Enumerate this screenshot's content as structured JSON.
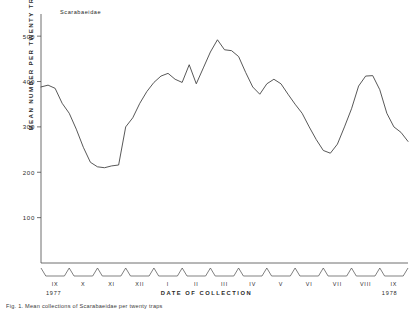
{
  "figure": {
    "annotation": "Scarabaeidae",
    "caption": "Fig. 1. Mean collections of Scarabaeidae per twenty traps"
  },
  "chart_data": {
    "type": "line",
    "title": "Scarabaeidae",
    "xlabel": "DATE OF COLLECTION",
    "ylabel": "MEAN NUMBER PER TWENTY TRAPS",
    "ylim": [
      0,
      540
    ],
    "yticks": [
      100,
      200,
      300,
      400,
      500
    ],
    "ytick_labels": [
      "100",
      "200",
      "300",
      "400",
      "500"
    ],
    "grid": false,
    "legend": null,
    "xtick_labels": [
      "IX",
      "X",
      "XI",
      "XII",
      "I",
      "II",
      "III",
      "IV",
      "V",
      "VI",
      "VII",
      "VIII",
      "IX"
    ],
    "period_labels": [
      "1977",
      "1978"
    ],
    "line_color": "#3a3a3a",
    "series": [
      {
        "name": "Scarabaeidae",
        "x": [
          0,
          1,
          2,
          3,
          4,
          5,
          6,
          7,
          8,
          9,
          10,
          11,
          12,
          13,
          14,
          15,
          16,
          17,
          18,
          19,
          20,
          21,
          22,
          23,
          24,
          25,
          26,
          27,
          28,
          29,
          30,
          31,
          32,
          33,
          34,
          35,
          36,
          37,
          38,
          39,
          40,
          41,
          42,
          43,
          44,
          45,
          46,
          47,
          48,
          49,
          50,
          51,
          52
        ],
        "values": [
          388,
          392,
          385,
          352,
          330,
          295,
          255,
          222,
          212,
          210,
          214,
          216,
          300,
          320,
          352,
          378,
          398,
          412,
          418,
          405,
          398,
          437,
          395,
          430,
          465,
          492,
          470,
          468,
          455,
          420,
          388,
          372,
          395,
          405,
          395,
          372,
          350,
          330,
          300,
          272,
          248,
          242,
          262,
          300,
          340,
          390,
          412,
          413,
          382,
          330,
          300,
          288,
          268
        ]
      }
    ]
  }
}
